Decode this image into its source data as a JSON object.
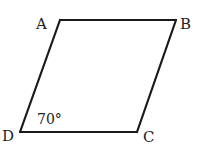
{
  "figure": {
    "type": "parallelogram",
    "vertices": [
      "A",
      "B",
      "C",
      "D"
    ],
    "angle_label": "70°",
    "angle_vertex": "D",
    "line_color": "#1a1a1a",
    "text_color": "#222222"
  },
  "labels": {
    "A": "A",
    "B": "B",
    "C": "C",
    "D": "D"
  }
}
